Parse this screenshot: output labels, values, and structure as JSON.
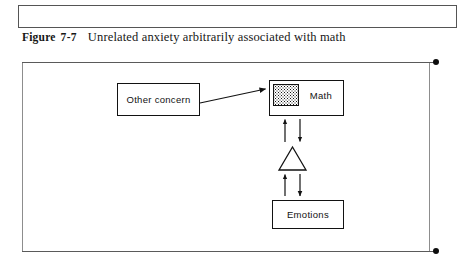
{
  "page": {
    "background_color": "#ffffff",
    "width": 463,
    "height": 264
  },
  "top_box": {
    "name": "empty-content-box",
    "text": "",
    "border_color": "#555555"
  },
  "caption": {
    "label": "Figure",
    "number": "7-7",
    "text": "Unrelated anxiety arbitrarily associated with math"
  },
  "figure": {
    "frame_border_color": "#8d8d8d",
    "rule_color": "#5a5a5a",
    "dot_color": "#0d0d0d",
    "edge_dots": [
      {
        "position": "top-right"
      },
      {
        "position": "bottom-right"
      }
    ],
    "nodes": [
      {
        "id": "other-concern",
        "label": "Other concern",
        "shape": "rectangle"
      },
      {
        "id": "math",
        "label": "Math",
        "shape": "rectangle",
        "marker": "stippled-square"
      },
      {
        "id": "triangle",
        "label": "",
        "shape": "triangle"
      },
      {
        "id": "emotions",
        "label": "Emotions",
        "shape": "rectangle"
      }
    ],
    "connections": [
      {
        "from": "other-concern",
        "to": "math",
        "style": "single-arrow",
        "direction": "one-way"
      },
      {
        "from": "math",
        "to": "triangle",
        "style": "double-arrow",
        "direction": "bidirectional"
      },
      {
        "from": "triangle",
        "to": "emotions",
        "style": "double-arrow",
        "direction": "bidirectional"
      }
    ],
    "stroke_color": "#121212"
  }
}
